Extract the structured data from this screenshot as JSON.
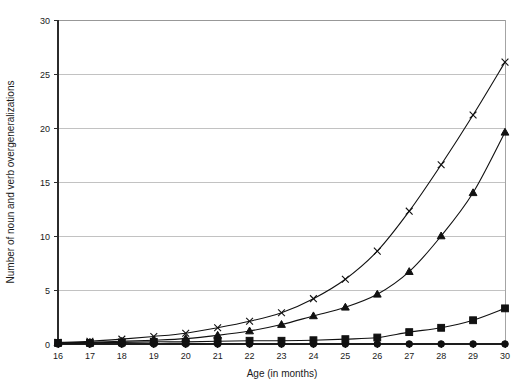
{
  "chart_data": {
    "type": "line",
    "title": "",
    "subtitle": "",
    "xlabel": "Age (in months)",
    "ylabel": "Number of noun and verb overgeneralizations",
    "x": [
      16,
      17,
      18,
      19,
      20,
      21,
      22,
      23,
      24,
      25,
      26,
      27,
      28,
      29,
      30
    ],
    "categories": [
      "16",
      "17",
      "18",
      "19",
      "20",
      "21",
      "22",
      "23",
      "24",
      "25",
      "26",
      "27",
      "28",
      "29",
      "30"
    ],
    "xlim": [
      16,
      30
    ],
    "ylim": [
      0,
      30
    ],
    "ytick_values": [
      0,
      5,
      10,
      15,
      20,
      25,
      30
    ],
    "ytick_labels": [
      "0",
      "5",
      "10",
      "15",
      "20",
      "25",
      "30"
    ],
    "grid": "horizontal",
    "legend": "none",
    "series": [
      {
        "name": "series-circle",
        "marker": "circle",
        "values": [
          0,
          0,
          0,
          0,
          0,
          0,
          0,
          0,
          0,
          0,
          0,
          0,
          0,
          0,
          0
        ]
      },
      {
        "name": "series-square",
        "marker": "square",
        "values": [
          0.1,
          0.1,
          0.15,
          0.2,
          0.2,
          0.25,
          0.3,
          0.3,
          0.35,
          0.45,
          0.6,
          1.1,
          1.5,
          2.2,
          3.3
        ]
      },
      {
        "name": "series-triangle",
        "marker": "triangle",
        "values": [
          0.1,
          0.15,
          0.25,
          0.35,
          0.5,
          0.8,
          1.2,
          1.8,
          2.6,
          3.4,
          4.6,
          6.7,
          10.0,
          14.0,
          19.6
        ]
      },
      {
        "name": "series-cross",
        "marker": "x",
        "values": [
          0.15,
          0.25,
          0.45,
          0.7,
          1.0,
          1.5,
          2.1,
          2.9,
          4.2,
          6.0,
          8.6,
          12.3,
          16.6,
          21.2,
          26.1
        ]
      }
    ],
    "colors": {
      "line": "#111111",
      "marker": "#111111",
      "grid": "#a8a8a8",
      "axis": "#2b2b2b",
      "background": "#ffffff"
    }
  }
}
